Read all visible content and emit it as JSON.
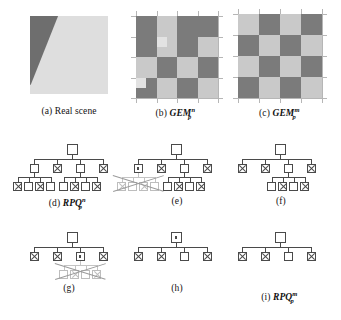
{
  "figure": {
    "background_color": "#ffffff",
    "line_color": "#4a4a4a",
    "faded_color": "#bdbdbd",
    "dark_cell_color": "#7b7b7b",
    "light_cell_color": "#c9c9c9",
    "scene_background_color": "#dedede",
    "scene_triangle_color": "#6e6e6e"
  },
  "captions": {
    "a": {
      "tag": "(a)",
      "text": "Real scene"
    },
    "b": {
      "tag": "(b)",
      "base": "GEM",
      "sup": "n",
      "sub": "p"
    },
    "c": {
      "tag": "(c)",
      "base": "GEM",
      "sup": "m",
      "sub": "p"
    },
    "d": {
      "tag": "(d)",
      "base": "RPQ",
      "sup": "n",
      "sub": "p"
    },
    "e": {
      "tag": "(e)",
      "text": ""
    },
    "f": {
      "tag": "(f)",
      "text": ""
    },
    "g": {
      "tag": "(g)",
      "text": ""
    },
    "h": {
      "tag": "(h)",
      "text": ""
    },
    "i": {
      "tag": "(i)",
      "base": "RPQ",
      "sup": "m",
      "sub": "p"
    }
  },
  "panels": {
    "real_scene": {
      "name": "real-scene",
      "description": "light gray square with a dark gray wedge along the left edge"
    },
    "gem_n": {
      "name": "gem-n-grid",
      "rows": 4,
      "cols": 4,
      "grid": [
        [
          "dark",
          "light",
          "dark",
          "dark"
        ],
        [
          "dark",
          "light",
          "dark",
          "light"
        ],
        [
          "light",
          "dark",
          "light",
          "dark"
        ],
        [
          "dark",
          "light",
          "dark",
          "light"
        ]
      ],
      "anomalies": [
        {
          "row": 1,
          "col": 1,
          "sub": "light-patch-top-left"
        },
        {
          "row": 3,
          "col": 0,
          "sub": "light-patch-top-left"
        }
      ]
    },
    "gem_m": {
      "name": "gem-m-grid",
      "rows": 4,
      "cols": 4,
      "grid": [
        [
          "light",
          "dark",
          "light",
          "dark"
        ],
        [
          "dark",
          "light",
          "dark",
          "light"
        ],
        [
          "light",
          "dark",
          "light",
          "dark"
        ],
        [
          "dark",
          "light",
          "dark",
          "light"
        ]
      ],
      "anomalies": []
    }
  },
  "trees": {
    "d": {
      "name": "tree-d",
      "root": "empty",
      "level2": [
        "empty",
        "cross",
        "empty",
        "cross"
      ],
      "level3_groups": [
        {
          "parent": 0,
          "nodes": [
            "cross",
            "empty",
            "cross",
            "empty"
          ]
        },
        {
          "parent": 2,
          "nodes": [
            "empty",
            "cross",
            "empty",
            "cross"
          ]
        }
      ],
      "pruned": null
    },
    "e": {
      "name": "tree-e",
      "root": "empty",
      "level2": [
        "dot",
        "cross",
        "empty",
        "cross"
      ],
      "level3_groups": [
        {
          "parent": 0,
          "nodes": [
            "cross",
            "empty",
            "cross",
            "empty"
          ],
          "faded": true
        },
        {
          "parent": 2,
          "nodes": [
            "empty",
            "cross",
            "empty",
            "cross"
          ],
          "faded": false
        }
      ],
      "pruned": "left-subtree-crossed-out"
    },
    "f": {
      "name": "tree-f",
      "root": "empty",
      "level2": [
        "cross",
        "cross",
        "empty",
        "cross"
      ],
      "level3_groups": [
        {
          "parent": 2,
          "nodes": [
            "empty",
            "cross",
            "empty",
            "cross"
          ],
          "faded": false
        }
      ],
      "pruned": null
    },
    "g": {
      "name": "tree-g",
      "root": "empty",
      "level2": [
        "cross",
        "cross",
        "dot",
        "cross"
      ],
      "level3_groups": [
        {
          "parent": 2,
          "nodes": [
            "empty",
            "cross",
            "empty",
            "cross"
          ],
          "faded": true
        }
      ],
      "pruned": "third-subtree-crossed-out"
    },
    "h": {
      "name": "tree-h",
      "root": "dot",
      "level2": [
        "cross",
        "cross",
        "empty",
        "cross"
      ],
      "level3_groups": [],
      "pruned": null
    },
    "i": {
      "name": "tree-i",
      "root": "empty",
      "level2": [
        "cross",
        "cross",
        "empty",
        "cross"
      ],
      "level3_groups": [],
      "pruned": null
    }
  }
}
